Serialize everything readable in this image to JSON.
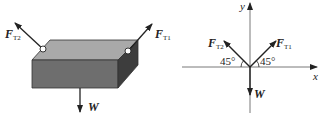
{
  "left_figure": {
    "forces": {
      "ft2": {
        "symbol": "F",
        "subscript": "T2"
      },
      "ft1": {
        "symbol": "F",
        "subscript": "T1"
      },
      "weight": {
        "symbol": "W"
      }
    },
    "colors": {
      "top_face": "#a9a9a9",
      "front_face": "#6e6e6e",
      "side_face": "#3d3d3d"
    }
  },
  "right_figure": {
    "axes": {
      "x": "x",
      "y": "y"
    },
    "forces": {
      "ft2": {
        "symbol": "F",
        "subscript": "T2"
      },
      "ft1": {
        "symbol": "F",
        "subscript": "T1"
      },
      "weight": {
        "symbol": "W"
      }
    },
    "angles": {
      "left": "45°",
      "right": "45°"
    }
  }
}
